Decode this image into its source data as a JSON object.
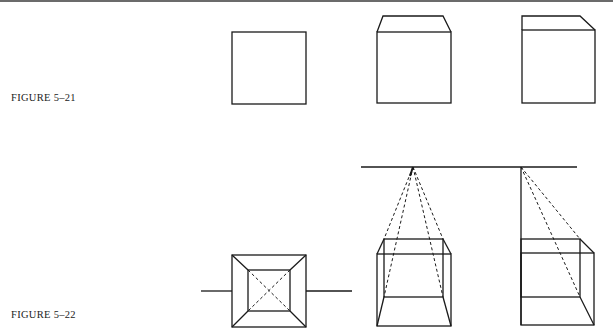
{
  "figures": [
    {
      "label": "FIGURE 5–21",
      "description": "Three stages of drawing a cube from a square: a plain square, a square with a symmetric top face in perspective, and a square with a top face receding to the right."
    },
    {
      "label": "FIGURE 5–22",
      "description": "Perspective constructions: a box seen from above with diagonals, a cube with dashed lines to a central vanishing point on the horizon, and a cube with dashed lines to a vanishing point at its left edge."
    }
  ],
  "colors": {
    "line": "#1a1a1a",
    "rule": "#6b6b6b",
    "background": "#ffffff"
  }
}
